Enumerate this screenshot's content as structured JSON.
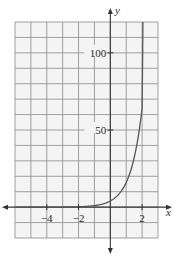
{
  "chart_data": {
    "type": "line",
    "title": "",
    "xlabel": "x",
    "ylabel": "y",
    "xlim": [
      -6,
      3
    ],
    "ylim": [
      -20,
      120
    ],
    "grid": true,
    "x_grid_step": 1,
    "y_grid_step": 10,
    "x_tick_labels": [
      {
        "value": -4,
        "label": "−4"
      },
      {
        "value": -2,
        "label": "−2"
      },
      {
        "value": 2,
        "label": "2"
      }
    ],
    "y_tick_labels": [
      {
        "value": 50,
        "label": "50"
      },
      {
        "value": 100,
        "label": "100"
      }
    ],
    "series": [
      {
        "name": "exponential curve",
        "x": [
          -6,
          -4,
          -2,
          -1,
          0,
          0.5,
          1,
          1.5,
          1.8,
          2,
          2.05
        ],
        "values": [
          0.0,
          0.02,
          0.25,
          1,
          4,
          8,
          16,
          32,
          48,
          64,
          120
        ]
      }
    ],
    "colors": {
      "grid": "#8a8a8a",
      "axis": "#333333",
      "curve": "#555555",
      "background": "#f4f4f4"
    }
  }
}
